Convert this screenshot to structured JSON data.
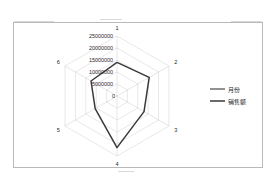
{
  "chart_data": {
    "type": "radar",
    "title": "",
    "categories": [
      "1",
      "2",
      "3",
      "4",
      "5",
      "6"
    ],
    "series": [
      {
        "name": "月份",
        "values": [
          1,
          2,
          3,
          4,
          5,
          6
        ]
      },
      {
        "name": "销售额",
        "values": [
          14000000,
          15500000,
          13000000,
          21500000,
          10500000,
          12500000
        ]
      }
    ],
    "radial_ticks": [
      "0",
      "5000000",
      "10000000",
      "15000000",
      "20000000",
      "25000000"
    ],
    "radial_tick_values": [
      0,
      5000000,
      10000000,
      15000000,
      20000000,
      25000000
    ],
    "rlim": [
      0,
      25000000
    ],
    "grid": true,
    "legend_position": "right",
    "xlabel": "",
    "ylabel": ""
  },
  "legend": {
    "entries": [
      {
        "label": "月份",
        "color": "#6e6e6e"
      },
      {
        "label": "销售额",
        "color": "#3a3a3a"
      }
    ]
  },
  "colors": {
    "frame_border": "#b9b9b9",
    "grid": "#c5c5c5",
    "series_month": "#6e6e6e",
    "series_sales": "#3a3a3a",
    "background": "#ffffff"
  }
}
